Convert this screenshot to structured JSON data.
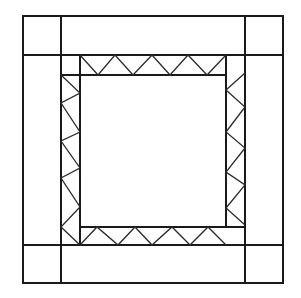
{
  "colors": {
    "line": "#1a1a1a",
    "zigzag": "#2a2a2a",
    "background": "#ffffff"
  },
  "geometry": {
    "outer": [
      23,
      16,
      283,
      283
    ],
    "corner_lines": {
      "x": [
        61,
        245
      ],
      "y": [
        55,
        245
      ]
    },
    "center": [
      80,
      75,
      226,
      227
    ]
  },
  "zigzags": {
    "top": "80,55 98,75 115,55 133,75 152,55 170,75 188,55 207,75 226,55",
    "left": "61,75 80,93 61,103 80,132 61,141 80,168 61,178 80,207 61,227",
    "right": "245,73 226,90 245,107 226,132 245,148 226,172 245,185 226,208 245,225",
    "bottom": "61,227 80,245 97,227 118,245 135,227 152,245 172,227 190,245 208,227 226,245"
  }
}
